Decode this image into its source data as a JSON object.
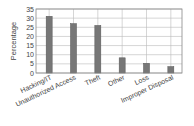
{
  "chart_data": {
    "type": "bar",
    "title": "",
    "xlabel": "",
    "ylabel": "Percentage",
    "ylim": [
      0,
      35
    ],
    "yticks": [
      0,
      5,
      10,
      15,
      20,
      25,
      30,
      35
    ],
    "grid": true,
    "legend": null,
    "categories": [
      "Hacking/IT",
      "Unauthorized Access",
      "Theft",
      "Other",
      "Loss",
      "Improper Disposal"
    ],
    "values": [
      31,
      27,
      26,
      8.3,
      5.3,
      3.5
    ],
    "bar_color": "#777777"
  }
}
